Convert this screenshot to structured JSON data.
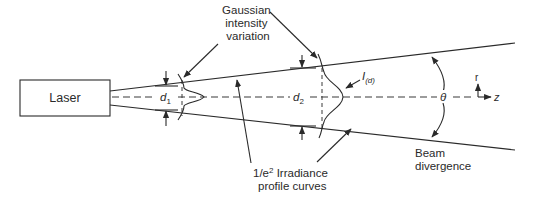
{
  "diagram": {
    "laser_label": "Laser",
    "gaussian_label_lines": [
      "Gaussian",
      "intensity",
      "variation"
    ],
    "irradiance_label_line1_prefix": "1/e",
    "irradiance_label_line1_sup": "2",
    "irradiance_label_line1_suffix": " Irradiance",
    "irradiance_label_line2": "profile curves",
    "divergence_label_lines": [
      "Beam",
      "divergence"
    ],
    "d1_label": "d",
    "d1_sub": "1",
    "d2_label": "d",
    "d2_sub": "2",
    "intensity_label": "I",
    "intensity_sub": "(d)",
    "theta_label": "θ",
    "axis_r_label": "r",
    "axis_z_label": "z",
    "colors": {
      "line": "#2a2a2a",
      "background": "#ffffff"
    }
  }
}
